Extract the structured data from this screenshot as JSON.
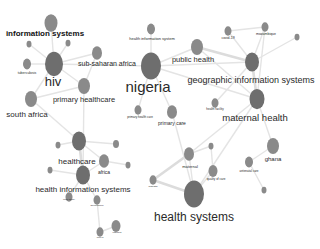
{
  "colors": {
    "node": "#8a8a8a",
    "edge": "#e4e4e4",
    "label": "#2a2a2a",
    "background": "#ffffff"
  },
  "nodes": [
    {
      "id": "information-systems",
      "label": "information systems",
      "x": 51,
      "y": 23,
      "r": 6.5,
      "lx": 45,
      "ly": 36,
      "fs": 8,
      "bold": true
    },
    {
      "id": "small-1",
      "label": "",
      "x": 29,
      "y": 44,
      "r": 2.5,
      "lx": 29,
      "ly": 49,
      "fs": 2.5
    },
    {
      "id": "small-2",
      "label": "",
      "x": 68,
      "y": 43,
      "r": 2.5,
      "lx": 68,
      "ly": 49,
      "fs": 2.5
    },
    {
      "id": "tuberculosis",
      "label": "tuberculosis",
      "x": 27,
      "y": 64,
      "r": 4,
      "lx": 27,
      "ly": 74,
      "fs": 3.5
    },
    {
      "id": "hiv",
      "label": "hiv",
      "x": 54,
      "y": 64,
      "r": 9,
      "lx": 53,
      "ly": 86,
      "fs": 13
    },
    {
      "id": "sub-saharan-africa",
      "label": "sub-saharan africa",
      "x": 97,
      "y": 53,
      "r": 5,
      "lx": 107,
      "ly": 66,
      "fs": 7
    },
    {
      "id": "primary-healthcare",
      "label": "primary healthcare",
      "x": 84,
      "y": 86,
      "r": 6,
      "lx": 84,
      "ly": 102,
      "fs": 7.5
    },
    {
      "id": "south-africa",
      "label": "south africa",
      "x": 31,
      "y": 99,
      "r": 6,
      "lx": 27,
      "ly": 117,
      "fs": 8
    },
    {
      "id": "health-information-system",
      "label": "health information system",
      "x": 151,
      "y": 29,
      "r": 4,
      "lx": 152,
      "ly": 40,
      "fs": 4
    },
    {
      "id": "nigeria",
      "label": "nigeria",
      "x": 151,
      "y": 66,
      "r": 10,
      "lx": 148,
      "ly": 92,
      "fs": 15
    },
    {
      "id": "primary-health-care",
      "label": "primary health care",
      "x": 138,
      "y": 110,
      "r": 3.5,
      "lx": 140,
      "ly": 118,
      "fs": 3
    },
    {
      "id": "primary-care",
      "label": "primary care",
      "x": 172,
      "y": 112,
      "r": 5,
      "lx": 172,
      "ly": 125,
      "fs": 5
    },
    {
      "id": "public-health",
      "label": "public health",
      "x": 197,
      "y": 47,
      "r": 6,
      "lx": 193,
      "ly": 62,
      "fs": 7.5
    },
    {
      "id": "covid-19",
      "label": "covid-19",
      "x": 228,
      "y": 31,
      "r": 3.5,
      "lx": 228,
      "ly": 39,
      "fs": 3.5
    },
    {
      "id": "mozambique",
      "label": "mozambique",
      "x": 265,
      "y": 27,
      "r": 3.5,
      "lx": 266,
      "ly": 35,
      "fs": 3.5
    },
    {
      "id": "small-3",
      "label": "",
      "x": 297,
      "y": 37,
      "r": 2.5,
      "lx": 297,
      "ly": 42,
      "fs": 3
    },
    {
      "id": "geographic-information-systems",
      "label": "geographic information systems",
      "x": 252,
      "y": 62,
      "r": 7,
      "lx": 251,
      "ly": 83,
      "fs": 9
    },
    {
      "id": "health-facility",
      "label": "health facility",
      "x": 215,
      "y": 103,
      "r": 3.5,
      "lx": 215,
      "ly": 110,
      "fs": 3
    },
    {
      "id": "maternal-health",
      "label": "maternal health",
      "x": 257,
      "y": 99,
      "r": 7.5,
      "lx": 255,
      "ly": 121,
      "fs": 9.5
    },
    {
      "id": "healthcare",
      "label": "healthcare",
      "x": 79,
      "y": 141,
      "r": 7,
      "lx": 77,
      "ly": 164,
      "fs": 8
    },
    {
      "id": "small-4",
      "label": "",
      "x": 58,
      "y": 145,
      "r": 2.5,
      "lx": 58,
      "ly": 150,
      "fs": 2.5
    },
    {
      "id": "small-5",
      "label": "",
      "x": 116,
      "y": 144,
      "r": 3,
      "lx": 116,
      "ly": 150,
      "fs": 2.5
    },
    {
      "id": "africa",
      "label": "africa",
      "x": 104,
      "y": 161,
      "r": 5,
      "lx": 104,
      "ly": 174,
      "fs": 5
    },
    {
      "id": "small-6",
      "label": "",
      "x": 50,
      "y": 170,
      "r": 2.5,
      "lx": 50,
      "ly": 175,
      "fs": 2.5
    },
    {
      "id": "small-7",
      "label": "",
      "x": 128,
      "y": 165,
      "r": 2.5,
      "lx": 128,
      "ly": 170,
      "fs": 2.5
    },
    {
      "id": "health-information-systems",
      "label": "health information systems",
      "x": 83,
      "y": 175,
      "r": 7,
      "lx": 83,
      "ly": 192,
      "fs": 8
    },
    {
      "id": "case-study",
      "label": "case study",
      "x": 69,
      "y": 197,
      "r": 3.5,
      "lx": 69,
      "ly": 200,
      "fs": 2.5
    },
    {
      "id": "governance",
      "label": "governance",
      "x": 97,
      "y": 200,
      "r": 3.5,
      "lx": 97,
      "ly": 206,
      "fs": 2.5
    },
    {
      "id": "ethiopia",
      "label": "ethiopia",
      "x": 116,
      "y": 226,
      "r": 4.5,
      "lx": 117,
      "ly": 233,
      "fs": 2.5
    },
    {
      "id": "kenya",
      "label": "kenya",
      "x": 100,
      "y": 232,
      "r": 3.5,
      "lx": 100,
      "ly": 238,
      "fs": 2.5
    },
    {
      "id": "maternal",
      "label": "maternal",
      "x": 189,
      "y": 154,
      "r": 5,
      "lx": 190,
      "ly": 168,
      "fs": 4
    },
    {
      "id": "small-8",
      "label": "",
      "x": 211,
      "y": 146,
      "r": 2.5,
      "lx": 211,
      "ly": 151,
      "fs": 2.5
    },
    {
      "id": "quality-of-care",
      "label": "quality of care",
      "x": 213,
      "y": 171,
      "r": 4.5,
      "lx": 216,
      "ly": 180,
      "fs": 3
    },
    {
      "id": "mhealth",
      "label": "mhealth",
      "x": 153,
      "y": 180,
      "r": 3.5,
      "lx": 153,
      "ly": 187,
      "fs": 2.5
    },
    {
      "id": "health-systems",
      "label": "health systems",
      "x": 194,
      "y": 194,
      "r": 10,
      "lx": 194,
      "ly": 221,
      "fs": 12
    },
    {
      "id": "ghana",
      "label": "ghana",
      "x": 273,
      "y": 146,
      "r": 6,
      "lx": 273,
      "ly": 161,
      "fs": 6
    },
    {
      "id": "antenatal-care",
      "label": "antenatal care",
      "x": 249,
      "y": 162,
      "r": 4,
      "lx": 249,
      "ly": 172,
      "fs": 3
    },
    {
      "id": "small-9",
      "label": "",
      "x": 264,
      "y": 190,
      "r": 2.5,
      "lx": 264,
      "ly": 195,
      "fs": 2.5
    }
  ],
  "edges": [
    [
      "information-systems",
      "hiv",
      0
    ],
    [
      "hiv",
      "tuberculosis",
      0
    ],
    [
      "hiv",
      "sub-saharan-africa",
      0
    ],
    [
      "hiv",
      "primary-healthcare",
      0
    ],
    [
      "hiv",
      "south-africa",
      0
    ],
    [
      "hiv",
      "nigeria",
      0
    ],
    [
      "hiv",
      "small-1",
      0
    ],
    [
      "hiv",
      "small-2",
      0
    ],
    [
      "sub-saharan-africa",
      "primary-healthcare",
      0
    ],
    [
      "south-africa",
      "healthcare",
      0
    ],
    [
      "south-africa",
      "primary-healthcare",
      0
    ],
    [
      "nigeria",
      "health-information-system",
      0
    ],
    [
      "nigeria",
      "primary-health-care",
      0
    ],
    [
      "nigeria",
      "primary-care",
      0
    ],
    [
      "nigeria",
      "public-health",
      0
    ],
    [
      "nigeria",
      "geographic-information-systems",
      0
    ],
    [
      "nigeria",
      "maternal-health",
      0
    ],
    [
      "public-health",
      "geographic-information-systems",
      1
    ],
    [
      "public-health",
      "maternal-health",
      0
    ],
    [
      "covid-19",
      "mozambique",
      0
    ],
    [
      "covid-19",
      "geographic-information-systems",
      0
    ],
    [
      "mozambique",
      "geographic-information-systems",
      0
    ],
    [
      "mozambique",
      "maternal-health",
      0
    ],
    [
      "small-3",
      "geographic-information-systems",
      0
    ],
    [
      "geographic-information-systems",
      "maternal-health",
      1
    ],
    [
      "geographic-information-systems",
      "health-facility",
      0
    ],
    [
      "maternal-health",
      "health-systems",
      0
    ],
    [
      "maternal-health",
      "maternal",
      0
    ],
    [
      "healthcare",
      "africa",
      0
    ],
    [
      "healthcare",
      "small-4",
      0
    ],
    [
      "healthcare",
      "small-5",
      0
    ],
    [
      "healthcare",
      "health-information-systems",
      1
    ],
    [
      "africa",
      "health-information-systems",
      0
    ],
    [
      "africa",
      "small-7",
      0
    ],
    [
      "health-information-systems",
      "small-6",
      0
    ],
    [
      "health-information-systems",
      "case-study",
      0
    ],
    [
      "health-information-systems",
      "governance",
      0
    ],
    [
      "governance",
      "kenya",
      0
    ],
    [
      "ethiopia",
      "kenya",
      0
    ],
    [
      "health-information-systems",
      "primary-healthcare",
      0
    ],
    [
      "maternal",
      "mhealth",
      1
    ],
    [
      "maternal",
      "health-systems",
      0
    ],
    [
      "maternal",
      "small-8",
      0
    ],
    [
      "quality-of-care",
      "health-systems",
      0
    ],
    [
      "small-8",
      "quality-of-care",
      0
    ],
    [
      "mhealth",
      "health-systems",
      1
    ],
    [
      "ghana",
      "antenatal-care",
      0
    ],
    [
      "ghana",
      "maternal-health",
      0
    ],
    [
      "antenatal-care",
      "small-9",
      0
    ],
    [
      "health-systems",
      "primary-care",
      0
    ]
  ]
}
